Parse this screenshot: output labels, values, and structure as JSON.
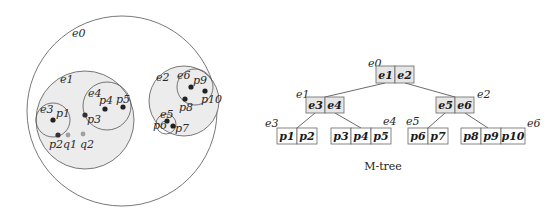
{
  "spatial": {
    "root_label": "e0",
    "regions": [
      {
        "id": "e0",
        "label": "e0",
        "cx": 122,
        "cy": 111,
        "r": 95,
        "fill": "#ffffff"
      },
      {
        "id": "e1",
        "label": "e1",
        "cx": 85,
        "cy": 120,
        "r": 49,
        "fill": "#ececec"
      },
      {
        "id": "e2",
        "label": "e2",
        "cx": 184,
        "cy": 101,
        "r": 35,
        "fill": "#ececec"
      },
      {
        "id": "e3",
        "label": "e3",
        "cx": 53,
        "cy": 120,
        "r": 17,
        "fill": "none"
      },
      {
        "id": "e4",
        "label": "e4",
        "cx": 107,
        "cy": 106,
        "r": 24,
        "fill": "none"
      },
      {
        "id": "e5",
        "label": "e5",
        "cx": 165,
        "cy": 125,
        "r": 10,
        "fill": "none"
      },
      {
        "id": "e6",
        "label": "e6",
        "cx": 195,
        "cy": 88,
        "r": 18,
        "fill": "none"
      }
    ],
    "points": [
      {
        "id": "p1",
        "label": "p1",
        "x": 53,
        "y": 120,
        "color": "#222222"
      },
      {
        "id": "p2",
        "label": "p2",
        "x": 58,
        "y": 135,
        "color": "#333333"
      },
      {
        "id": "p3",
        "label": "p3",
        "x": 85,
        "y": 115,
        "color": "#333333"
      },
      {
        "id": "p4",
        "label": "p4",
        "x": 105,
        "y": 109,
        "color": "#222222"
      },
      {
        "id": "p5",
        "label": "p5",
        "x": 123,
        "y": 107,
        "color": "#222222"
      },
      {
        "id": "p6",
        "label": "p6",
        "x": 167,
        "y": 121,
        "color": "#222222"
      },
      {
        "id": "p7",
        "label": "p7",
        "x": 173,
        "y": 126,
        "color": "#222222"
      },
      {
        "id": "p8",
        "label": "p8",
        "x": 185,
        "y": 99,
        "color": "#222222"
      },
      {
        "id": "p9",
        "label": "p9",
        "x": 191,
        "y": 87,
        "color": "#222222"
      },
      {
        "id": "p10",
        "label": "p10",
        "x": 205,
        "y": 91,
        "color": "#222222"
      },
      {
        "id": "q1",
        "label": "q1",
        "x": 68,
        "y": 135,
        "color": "#a0a0a0"
      },
      {
        "id": "q2",
        "label": "q2",
        "x": 83,
        "y": 134,
        "color": "#a0a0a0"
      }
    ]
  },
  "tree": {
    "caption": "M-tree",
    "node_fill_internal": "#e6e6e6",
    "node_fill_leaf": "#ffffff",
    "nodes": [
      {
        "id": "e0",
        "label": "e0",
        "entries": [
          "e1",
          "e2"
        ],
        "level": 0
      },
      {
        "id": "e1",
        "label": "e1",
        "entries": [
          "e3",
          "e4"
        ],
        "level": 1
      },
      {
        "id": "e2",
        "label": "e2",
        "entries": [
          "e5",
          "e6"
        ],
        "level": 1
      },
      {
        "id": "e3",
        "label": "e3",
        "entries": [
          "p1",
          "p2"
        ],
        "level": 2
      },
      {
        "id": "e4",
        "label": "e4",
        "entries": [
          "p3",
          "p4",
          "p5"
        ],
        "level": 2
      },
      {
        "id": "e5",
        "label": "e5",
        "entries": [
          "p6",
          "p7"
        ],
        "level": 2
      },
      {
        "id": "e6",
        "label": "e6",
        "entries": [
          "p8",
          "p9",
          "p10"
        ],
        "level": 2
      }
    ]
  }
}
